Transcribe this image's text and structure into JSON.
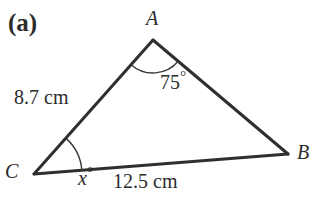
{
  "figure": {
    "part_label": "(a)",
    "shape": "triangle",
    "background_color": "#ffffff",
    "stroke_color": "#2f2f2f",
    "text_color": "#2b2b2b",
    "stroke_width": 3,
    "arc_stroke_width": 1.4,
    "vertices": [
      {
        "name": "A",
        "label": "A",
        "x": 153,
        "y": 40
      },
      {
        "name": "B",
        "label": "B",
        "x": 288,
        "y": 154
      },
      {
        "name": "C",
        "label": "C",
        "x": 34,
        "y": 174
      }
    ],
    "vertex_labels": {
      "A": "A",
      "B": "B",
      "C": "C"
    },
    "sides": [
      {
        "name": "CA",
        "label": "8.7 cm",
        "value": 8.7,
        "unit": "cm",
        "from": "C",
        "to": "A"
      },
      {
        "name": "CB",
        "label": "12.5 cm",
        "value": 12.5,
        "unit": "cm",
        "from": "C",
        "to": "B"
      },
      {
        "name": "AB",
        "label": "",
        "value": null,
        "unit": "",
        "from": "A",
        "to": "B"
      }
    ],
    "angles": [
      {
        "at": "A",
        "label": "75",
        "degree_symbol": "°",
        "value": 75,
        "known": true,
        "arc_radius": 33
      },
      {
        "at": "C",
        "label": "x",
        "degree_symbol": "°",
        "value": null,
        "known": false,
        "arc_radius": 48
      }
    ]
  }
}
